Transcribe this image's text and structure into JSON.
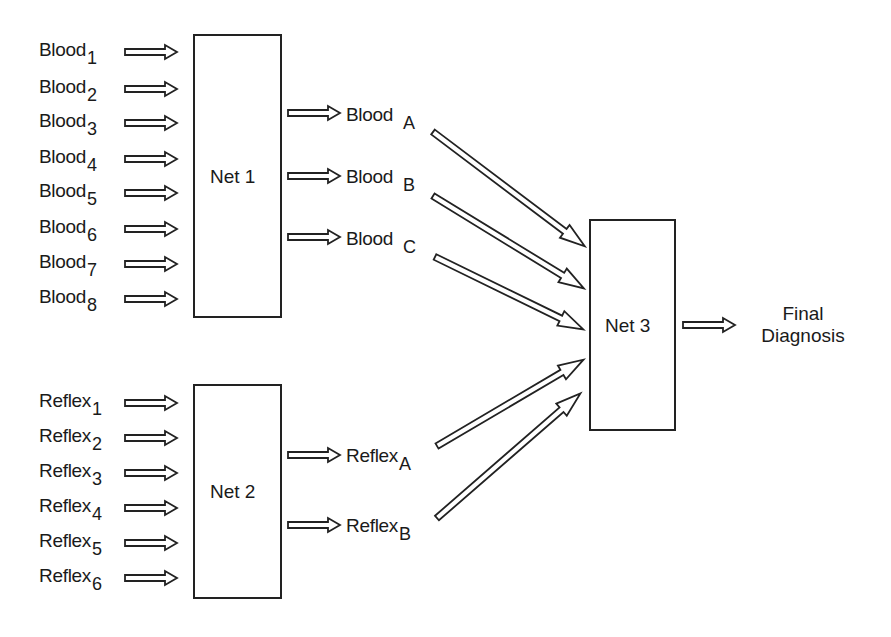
{
  "blood_inputs": [
    {
      "base": "Blood",
      "sub": "1"
    },
    {
      "base": "Blood",
      "sub": "2"
    },
    {
      "base": "Blood",
      "sub": "3"
    },
    {
      "base": "Blood",
      "sub": "4"
    },
    {
      "base": "Blood",
      "sub": "5"
    },
    {
      "base": "Blood",
      "sub": "6"
    },
    {
      "base": "Blood",
      "sub": "7"
    },
    {
      "base": "Blood",
      "sub": "8"
    }
  ],
  "reflex_inputs": [
    {
      "base": "Reflex",
      "sub": "1"
    },
    {
      "base": "Reflex",
      "sub": "2"
    },
    {
      "base": "Reflex",
      "sub": "3"
    },
    {
      "base": "Reflex",
      "sub": "4"
    },
    {
      "base": "Reflex",
      "sub": "5"
    },
    {
      "base": "Reflex",
      "sub": "6"
    }
  ],
  "nets": {
    "net1": "Net 1",
    "net2": "Net 2",
    "net3": "Net 3"
  },
  "blood_outputs": [
    {
      "base": "Blood",
      "sub": "A"
    },
    {
      "base": "Blood",
      "sub": "B"
    },
    {
      "base": "Blood",
      "sub": "C"
    }
  ],
  "reflex_outputs": [
    {
      "base": "Reflex",
      "sub": "A"
    },
    {
      "base": "Reflex",
      "sub": "B"
    }
  ],
  "final": {
    "line1": "Final",
    "line2": "Diagnosis"
  }
}
